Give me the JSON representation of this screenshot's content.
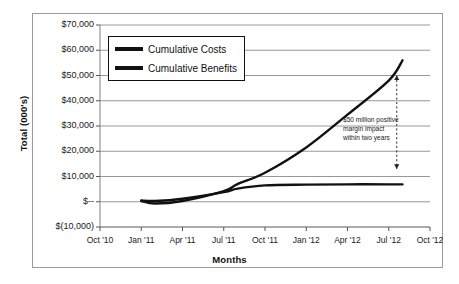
{
  "chart_data": {
    "type": "line",
    "title": "",
    "xlabel": "Months",
    "ylabel": "Total (000's)",
    "ylim": [
      -10000,
      70000
    ],
    "ytick_values": [
      70000,
      60000,
      50000,
      40000,
      30000,
      20000,
      10000,
      0,
      -10000
    ],
    "ytick_labels": [
      "$70,000",
      "$60,000",
      "$50,000",
      "$40,000",
      "$30,000",
      "$20,000",
      "$10,000",
      "$--",
      "$(10,000)"
    ],
    "xtick_labels": [
      "Oct '10",
      "Jan '11",
      "Apr '11",
      "Jul '11",
      "Oct '11",
      "Jan '12",
      "Apr '12",
      "Jul '12",
      "Oct '12"
    ],
    "grid": true,
    "legend_position": "upper-left-inside",
    "series": [
      {
        "name": "Cumulative Costs",
        "color": "#111111",
        "x": [
          "Jan '11",
          "Feb '11",
          "Apr '11",
          "Jul '11",
          "Aug '11",
          "Oct '11",
          "Jan '12",
          "Apr '12",
          "Jul '12",
          "Aug '12"
        ],
        "values": [
          500,
          300,
          1200,
          3800,
          5200,
          6500,
          6800,
          6900,
          6900,
          6900
        ]
      },
      {
        "name": "Cumulative Benefits",
        "color": "#111111",
        "x": [
          "Jan '11",
          "Feb '11",
          "Apr '11",
          "Jul '11",
          "Aug '11",
          "Oct '11",
          "Jan '12",
          "Apr '12",
          "Jul '12",
          "Aug '12"
        ],
        "values": [
          300,
          -700,
          300,
          4200,
          7000,
          11500,
          21500,
          34500,
          48000,
          56000
        ]
      }
    ],
    "annotations": [
      {
        "name": "margin-impact-callout",
        "lines": [
          "$50 million positive",
          "margin impact",
          "within two years"
        ],
        "arrow": {
          "style": "dashed-double-headed-vertical",
          "top_value": 50000,
          "bottom_value": 13000,
          "at_x": "Jul '12"
        }
      }
    ]
  },
  "legend": {
    "items": [
      {
        "label": "Cumulative Costs"
      },
      {
        "label": "Cumulative Benefits"
      }
    ]
  }
}
